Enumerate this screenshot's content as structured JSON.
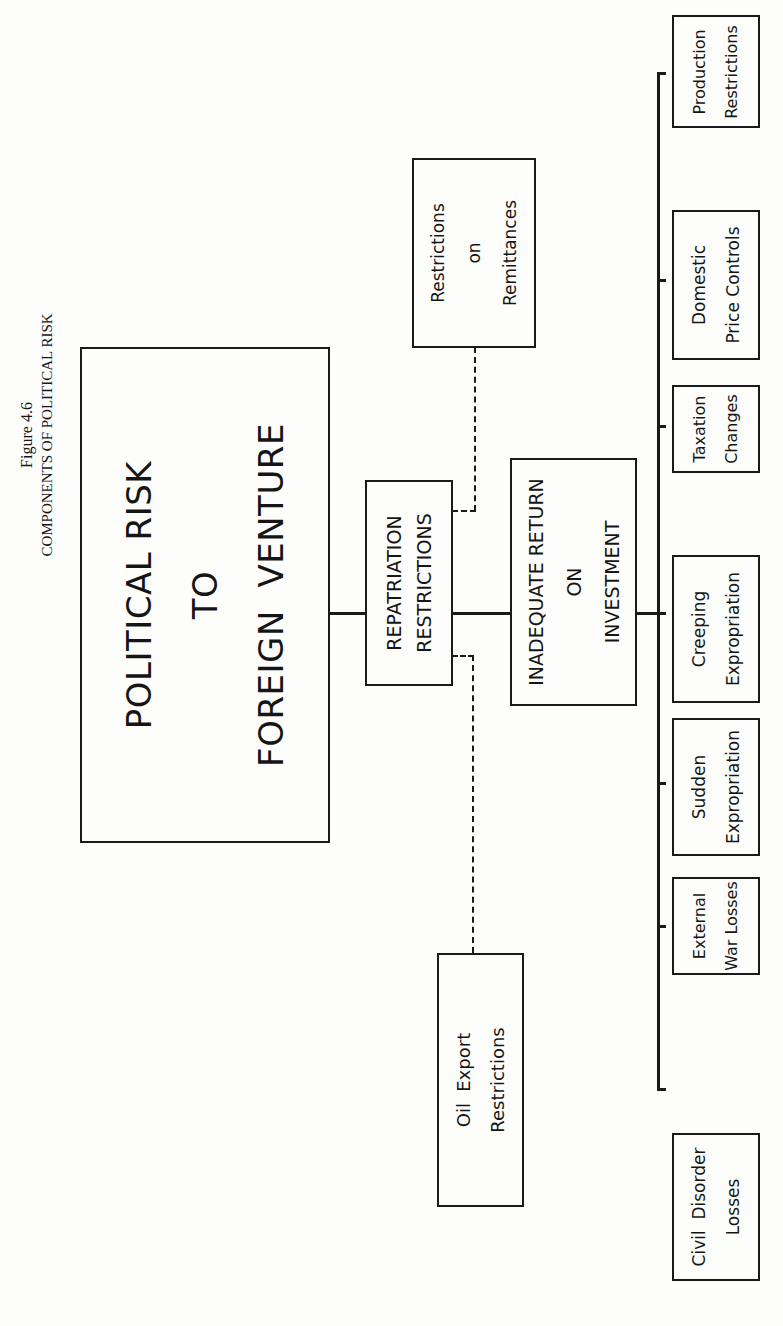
{
  "figure": {
    "number": "Figure 4.6",
    "title": "COMPONENTS OF POLITICAL RISK"
  },
  "root": {
    "lines": [
      "POLITICAL RISK",
      "TO",
      "FOREIGN  VENTURE"
    ]
  },
  "branches": {
    "repatriation": {
      "lines": [
        "REPATRIATION",
        "RESTRICTIONS"
      ],
      "sub": {
        "remittances": {
          "lines": [
            "Restrictions",
            "on",
            "Remittances"
          ]
        },
        "oil_export": {
          "lines": [
            "Oil  Export",
            "Restrictions"
          ]
        }
      }
    },
    "inadequate_return": {
      "lines": [
        "INADEQUATE RETURN",
        "ON",
        "INVESTMENT"
      ]
    }
  },
  "components": [
    {
      "lines": [
        "Civil  Disorder",
        "Losses"
      ]
    },
    {
      "lines": [
        "External",
        "War Losses"
      ]
    },
    {
      "lines": [
        "Sudden",
        "Expropriation"
      ]
    },
    {
      "lines": [
        "Creeping",
        "Expropriation"
      ]
    },
    {
      "lines": [
        "Taxation",
        "Changes"
      ]
    },
    {
      "lines": [
        "Domestic",
        "Price Controls"
      ]
    },
    {
      "lines": [
        "Production",
        "Restrictions"
      ]
    }
  ],
  "colors": {
    "ink": "#1a1a1a",
    "paper": "#fdfdfb"
  }
}
